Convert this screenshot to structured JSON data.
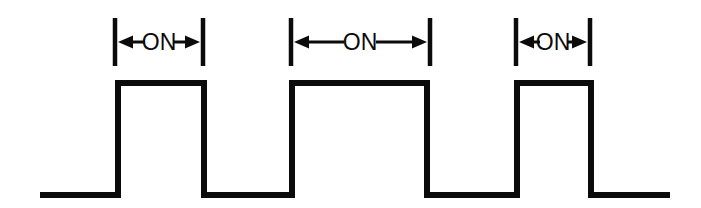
{
  "figure": {
    "background_color": "#ffffff",
    "stroke_color": "#0b0b0b",
    "width": 701,
    "height": 208
  },
  "chart_data": {
    "type": "line",
    "title": "",
    "xlabel": "",
    "ylabel": "",
    "waveform": "square-pulse-train",
    "levels": {
      "low_label": "OFF",
      "high_label": "ON",
      "low_y_px": 195,
      "high_y_px": 83
    },
    "line_width_px": 6,
    "baseline_start_x": 40,
    "baseline_end_x": 670,
    "x": [
      40,
      118,
      118,
      204,
      204,
      292,
      292,
      427,
      427,
      517,
      517,
      591,
      591,
      670
    ],
    "y": [
      195,
      195,
      83,
      83,
      195,
      195,
      83,
      83,
      195,
      195,
      83,
      83,
      195,
      195
    ],
    "pulses": [
      {
        "index": 1,
        "rise_x": 118,
        "fall_x": 204,
        "on_width_px": 86
      },
      {
        "index": 2,
        "rise_x": 292,
        "fall_x": 427,
        "on_width_px": 135
      },
      {
        "index": 3,
        "rise_x": 517,
        "fall_x": 591,
        "on_width_px": 74
      }
    ],
    "annotations": [
      {
        "label": "ON",
        "left_tick_x": 115,
        "right_tick_x": 203,
        "tick_top_y": 18,
        "tick_bottom_y": 66,
        "arrow_y": 42,
        "text_x": 159
      },
      {
        "label": "ON",
        "left_tick_x": 291,
        "right_tick_x": 430,
        "tick_top_y": 18,
        "tick_bottom_y": 66,
        "arrow_y": 42,
        "text_x": 360
      },
      {
        "label": "ON",
        "left_tick_x": 516,
        "right_tick_x": 590,
        "tick_top_y": 18,
        "tick_bottom_y": 66,
        "arrow_y": 42,
        "text_x": 553
      }
    ],
    "legend": [],
    "grid": false
  },
  "annotations": {
    "items": [
      {
        "label": "ON"
      },
      {
        "label": "ON"
      },
      {
        "label": "ON"
      }
    ]
  }
}
